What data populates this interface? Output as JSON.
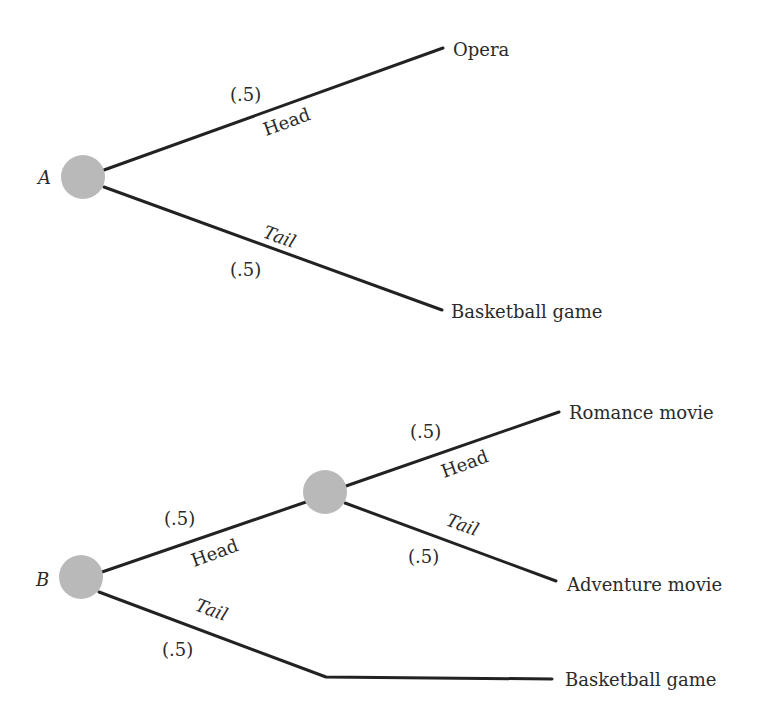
{
  "colors": {
    "edge": "#222222",
    "node": "#b9b9b9",
    "text": "#2a2a2a",
    "background": "#ffffff"
  },
  "tree_a": {
    "root_label": "A",
    "head": {
      "label": "Head",
      "prob": "(.5)",
      "outcome": "Opera"
    },
    "tail": {
      "label": "Tail",
      "prob": "(.5)",
      "outcome": "Basketball game"
    }
  },
  "tree_b": {
    "root_label": "B",
    "head": {
      "label": "Head",
      "prob": "(.5)",
      "sub_head": {
        "label": "Head",
        "prob": "(.5)",
        "outcome": "Romance movie"
      },
      "sub_tail": {
        "label": "Tail",
        "prob": "(.5)",
        "outcome": "Adventure movie"
      }
    },
    "tail": {
      "label": "Tail",
      "prob": "(.5)",
      "outcome": "Basketball game"
    }
  }
}
